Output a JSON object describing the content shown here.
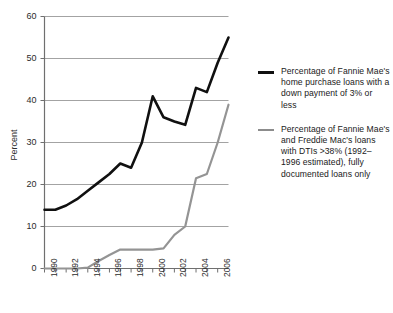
{
  "chart_data": {
    "type": "line",
    "title": "",
    "xlabel": "",
    "ylabel": "Percent",
    "xlim": [
      1990,
      2007
    ],
    "ylim": [
      0,
      60
    ],
    "grid": true,
    "legend_position": "right",
    "x": [
      1990,
      1991,
      1992,
      1993,
      1994,
      1995,
      1996,
      1997,
      1998,
      1999,
      2000,
      2001,
      2002,
      2003,
      2004,
      2005,
      2006,
      2007
    ],
    "ytick_labels": [
      "0",
      "10",
      "20",
      "30",
      "40",
      "50",
      "60"
    ],
    "ytick_values": [
      0,
      10,
      20,
      30,
      40,
      50,
      60
    ],
    "xtick_labels": [
      "1990",
      "1992",
      "1994",
      "1996",
      "1998",
      "2000",
      "2002",
      "2004",
      "2006"
    ],
    "xtick_values": [
      1990,
      1992,
      1994,
      1996,
      1998,
      2000,
      2002,
      2004,
      2006
    ],
    "series": [
      {
        "name": "Percentage of Fannie Mae's home purchase loans with a down payment of 3% or less",
        "color": "#101010",
        "width": 2.6,
        "values": [
          14.0,
          14.0,
          15.0,
          16.5,
          18.5,
          20.5,
          22.5,
          25.0,
          24.0,
          30.0,
          41.0,
          36.0,
          35.0,
          34.2,
          43.0,
          42.0,
          49.0,
          55.0
        ]
      },
      {
        "name": "Percentage of Fannie Mae's and Freddie Mac's loans with DTIs >38% (1992–1996 estimated), fully documented loans only",
        "color": "#949494",
        "width": 2.2,
        "values": [
          0.0,
          0.0,
          0.0,
          0.0,
          0.2,
          1.8,
          3.2,
          4.5,
          4.5,
          4.5,
          4.5,
          4.8,
          8.0,
          10.0,
          21.5,
          22.5,
          30.0,
          39.0
        ]
      }
    ]
  },
  "legend": {
    "entries": [
      {
        "marker": "black-line-swatch",
        "label": "Percentage of Fannie Mae's home purchase loans with a down payment of 3% or less"
      },
      {
        "marker": "gray-line-swatch",
        "label": "Percentage of Fannie Mae's and Freddie Mac's loans with DTIs >38% (1992–1996 estimated), fully documented loans only"
      }
    ]
  },
  "axes": {
    "y_title": "Percent",
    "grid_color": "#a3a3a3",
    "axis_color": "#6f6f6f"
  }
}
